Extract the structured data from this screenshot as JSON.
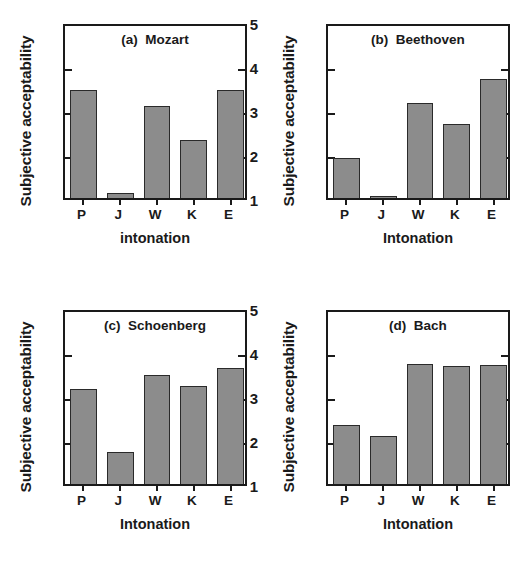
{
  "figure": {
    "width": 526,
    "height": 572,
    "background": "#ffffff",
    "bar_color": "#8c8c8c",
    "bar_edge_color": "#2a2a2a",
    "axis_color": "#1a1a1a"
  },
  "chart_data": [
    {
      "type": "bar",
      "panel": "a",
      "title": "(a)  Mozart",
      "categories": [
        "P",
        "J",
        "W",
        "K",
        "E"
      ],
      "values": [
        3.45,
        1.11,
        3.1,
        2.31,
        3.46
      ],
      "xlabel": "intonation",
      "ylabel": "Subjective acceptability",
      "ylim": [
        1,
        5
      ],
      "yticks": [
        1,
        2,
        3,
        4,
        5
      ],
      "ytick_labels": [
        "1",
        "2",
        "3",
        "4",
        "5"
      ],
      "grid": false,
      "legend": null
    },
    {
      "type": "bar",
      "panel": "b",
      "title": "(b)  Beethoven",
      "categories": [
        "P",
        "J",
        "W",
        "K",
        "E"
      ],
      "values": [
        1.91,
        1.04,
        3.17,
        2.68,
        3.71
      ],
      "xlabel": "Intonation",
      "ylabel": "Subjective acceptability",
      "ylim": [
        1,
        5
      ],
      "yticks": [
        1,
        2,
        3,
        4,
        5
      ],
      "ytick_labels": [
        "1",
        "2",
        "3",
        "4",
        "5"
      ],
      "grid": false,
      "legend": null
    },
    {
      "type": "bar",
      "panel": "c",
      "title": "(c)  Schoenberg",
      "categories": [
        "P",
        "J",
        "W",
        "K",
        "E"
      ],
      "values": [
        3.16,
        1.72,
        3.47,
        3.23,
        3.63
      ],
      "xlabel": "Intonation",
      "ylabel": "Subjective acceptability",
      "ylim": [
        1,
        5
      ],
      "yticks": [
        1,
        2,
        3,
        4,
        5
      ],
      "ytick_labels": [
        "1",
        "2",
        "3",
        "4",
        "5"
      ],
      "grid": false,
      "legend": null
    },
    {
      "type": "bar",
      "panel": "d",
      "title": "(d)  Bach",
      "categories": [
        "P",
        "J",
        "W",
        "K",
        "E"
      ],
      "values": [
        2.35,
        2.08,
        3.72,
        3.68,
        3.71
      ],
      "xlabel": "Intonation",
      "ylabel": "Subjective acceptability",
      "ylim": [
        1,
        5
      ],
      "yticks": [
        1,
        2,
        3,
        4,
        5
      ],
      "ytick_labels": [
        "1",
        "2",
        "3",
        "4",
        "5"
      ],
      "grid": false,
      "legend": null
    }
  ]
}
